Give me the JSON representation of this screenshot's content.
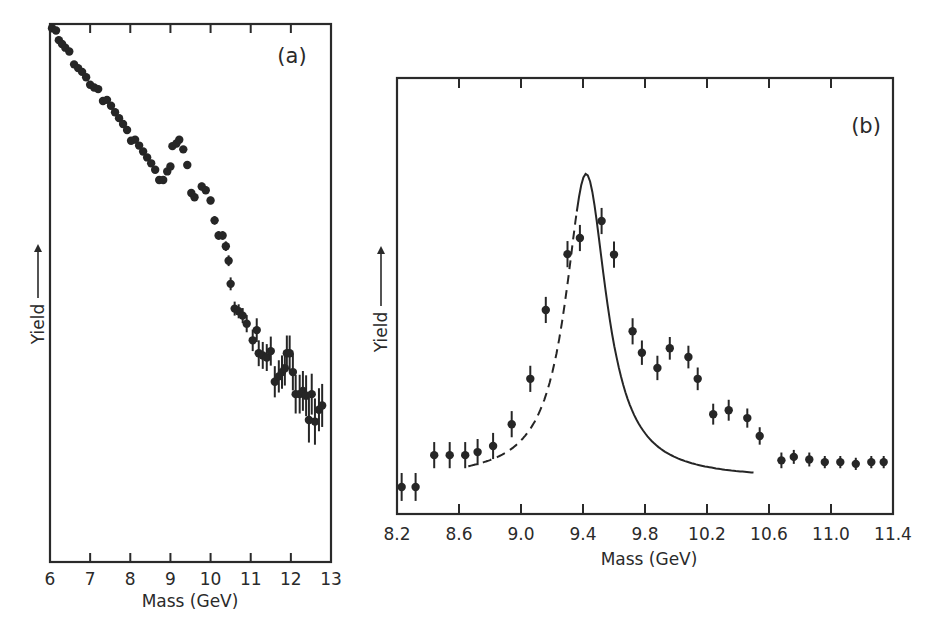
{
  "figure": {
    "panels": [
      {
        "id": "a",
        "tag": "(a)",
        "xlabel": "Mass (GeV)",
        "ylabel": "Yield —→"
      },
      {
        "id": "b",
        "tag": "(b)",
        "xlabel": "Mass (GeV)",
        "ylabel": "Yield —→"
      }
    ]
  },
  "chart_data": [
    {
      "panel": "(a)",
      "type": "scatter",
      "title": "",
      "xlabel": "Mass (GeV)",
      "ylabel": "Yield →",
      "xlim": [
        6,
        13
      ],
      "ylim": [
        0,
        100
      ],
      "xticks": [
        6,
        7,
        8,
        9,
        10,
        11,
        12,
        13
      ],
      "xtick_labels": [
        "6",
        "7",
        "8",
        "9",
        "10",
        "11",
        "12",
        "13"
      ],
      "yticks": [],
      "y_units": "relative yield (arbitrary, no scale shown)",
      "grid": false,
      "legend": null,
      "annotations": [
        "(a)"
      ],
      "series": [
        {
          "name": "data",
          "points": [
            {
              "x": 6.05,
              "y": 99.2,
              "err": 0
            },
            {
              "x": 6.15,
              "y": 98.8,
              "err": 0
            },
            {
              "x": 6.22,
              "y": 97.0,
              "err": 0
            },
            {
              "x": 6.3,
              "y": 96.3,
              "err": 0
            },
            {
              "x": 6.38,
              "y": 95.6,
              "err": 0
            },
            {
              "x": 6.48,
              "y": 94.9,
              "err": 0
            },
            {
              "x": 6.6,
              "y": 92.5,
              "err": 0
            },
            {
              "x": 6.7,
              "y": 91.8,
              "err": 0
            },
            {
              "x": 6.8,
              "y": 91.1,
              "err": 0
            },
            {
              "x": 6.9,
              "y": 90.1,
              "err": 0
            },
            {
              "x": 7.0,
              "y": 88.7,
              "err": 0
            },
            {
              "x": 7.1,
              "y": 88.2,
              "err": 0
            },
            {
              "x": 7.2,
              "y": 87.9,
              "err": 0
            },
            {
              "x": 7.32,
              "y": 85.7,
              "err": 0
            },
            {
              "x": 7.42,
              "y": 85.9,
              "err": 0
            },
            {
              "x": 7.52,
              "y": 84.8,
              "err": 0
            },
            {
              "x": 7.62,
              "y": 83.6,
              "err": 0
            },
            {
              "x": 7.72,
              "y": 82.5,
              "err": 0
            },
            {
              "x": 7.82,
              "y": 81.4,
              "err": 0
            },
            {
              "x": 7.92,
              "y": 80.3,
              "err": 0
            },
            {
              "x": 8.02,
              "y": 78.3,
              "err": 0
            },
            {
              "x": 8.12,
              "y": 78.5,
              "err": 0
            },
            {
              "x": 8.22,
              "y": 77.4,
              "err": 0
            },
            {
              "x": 8.32,
              "y": 76.3,
              "err": 0
            },
            {
              "x": 8.42,
              "y": 75.2,
              "err": 0
            },
            {
              "x": 8.52,
              "y": 74.1,
              "err": 0
            },
            {
              "x": 8.62,
              "y": 72.9,
              "err": 0
            },
            {
              "x": 8.72,
              "y": 71.0,
              "err": 0.6
            },
            {
              "x": 8.82,
              "y": 71.0,
              "err": 0.6
            },
            {
              "x": 8.92,
              "y": 72.6,
              "err": 0.6
            },
            {
              "x": 9.0,
              "y": 73.5,
              "err": 0.6
            },
            {
              "x": 9.05,
              "y": 77.3,
              "err": 0.6
            },
            {
              "x": 9.15,
              "y": 77.8,
              "err": 0.6
            },
            {
              "x": 9.22,
              "y": 78.5,
              "err": 0.6
            },
            {
              "x": 9.32,
              "y": 76.7,
              "err": 0.6
            },
            {
              "x": 9.42,
              "y": 73.8,
              "err": 0.6
            },
            {
              "x": 9.52,
              "y": 68.6,
              "err": 0.7
            },
            {
              "x": 9.6,
              "y": 67.8,
              "err": 0.7
            },
            {
              "x": 9.78,
              "y": 69.8,
              "err": 0.7
            },
            {
              "x": 9.88,
              "y": 69.1,
              "err": 0.7
            },
            {
              "x": 10.0,
              "y": 67.2,
              "err": 0.7
            },
            {
              "x": 10.1,
              "y": 63.5,
              "err": 0.8
            },
            {
              "x": 10.2,
              "y": 60.7,
              "err": 0.8
            },
            {
              "x": 10.3,
              "y": 60.7,
              "err": 0.8
            },
            {
              "x": 10.38,
              "y": 58.7,
              "err": 0.9
            },
            {
              "x": 10.45,
              "y": 56.0,
              "err": 1.0
            },
            {
              "x": 10.5,
              "y": 51.7,
              "err": 1.2
            },
            {
              "x": 10.6,
              "y": 47.1,
              "err": 1.3
            },
            {
              "x": 10.7,
              "y": 46.6,
              "err": 1.3
            },
            {
              "x": 10.8,
              "y": 45.8,
              "err": 1.4
            },
            {
              "x": 10.9,
              "y": 44.3,
              "err": 1.6
            },
            {
              "x": 11.05,
              "y": 41.2,
              "err": 2.0
            },
            {
              "x": 11.15,
              "y": 43.1,
              "err": 2.2
            },
            {
              "x": 11.2,
              "y": 38.8,
              "err": 2.4
            },
            {
              "x": 11.3,
              "y": 38.4,
              "err": 2.5
            },
            {
              "x": 11.4,
              "y": 38.0,
              "err": 2.5
            },
            {
              "x": 11.5,
              "y": 39.2,
              "err": 2.7
            },
            {
              "x": 11.6,
              "y": 33.5,
              "err": 2.9
            },
            {
              "x": 11.7,
              "y": 34.5,
              "err": 3.0
            },
            {
              "x": 11.78,
              "y": 35.3,
              "err": 3.1
            },
            {
              "x": 11.85,
              "y": 36.0,
              "err": 3.2
            },
            {
              "x": 11.9,
              "y": 38.8,
              "err": 3.3
            },
            {
              "x": 11.97,
              "y": 38.8,
              "err": 3.3
            },
            {
              "x": 12.05,
              "y": 35.3,
              "err": 3.4
            },
            {
              "x": 12.12,
              "y": 31.2,
              "err": 3.6
            },
            {
              "x": 12.22,
              "y": 31.2,
              "err": 3.6
            },
            {
              "x": 12.3,
              "y": 31.8,
              "err": 3.7
            },
            {
              "x": 12.38,
              "y": 30.9,
              "err": 3.8
            },
            {
              "x": 12.45,
              "y": 26.4,
              "err": 4.2
            },
            {
              "x": 12.52,
              "y": 31.2,
              "err": 3.8
            },
            {
              "x": 12.6,
              "y": 26.1,
              "err": 4.3
            },
            {
              "x": 12.7,
              "y": 28.3,
              "err": 4.0
            },
            {
              "x": 12.78,
              "y": 29.1,
              "err": 4.0
            }
          ]
        }
      ]
    },
    {
      "panel": "(b)",
      "type": "scatter",
      "title": "",
      "xlabel": "Mass (GeV)",
      "ylabel": "Yield →",
      "xlim": [
        8.2,
        11.4
      ],
      "ylim": [
        0,
        100
      ],
      "xticks": [
        8.2,
        8.6,
        9.0,
        9.4,
        9.8,
        10.2,
        10.6,
        11.0,
        11.4
      ],
      "xtick_labels": [
        "8.2",
        "8.6",
        "9.0",
        "9.4",
        "9.8",
        "10.2",
        "10.6",
        "11.0",
        "11.4"
      ],
      "yticks": [],
      "y_units": "relative yield (arbitrary, no scale shown)",
      "grid": false,
      "legend": null,
      "annotations": [
        "(b)"
      ],
      "series": [
        {
          "name": "data",
          "points": [
            {
              "x": 8.23,
              "y": 6.2,
              "err": 3.2
            },
            {
              "x": 8.32,
              "y": 6.2,
              "err": 3.2
            },
            {
              "x": 8.44,
              "y": 13.5,
              "err": 3.0
            },
            {
              "x": 8.54,
              "y": 13.5,
              "err": 3.0
            },
            {
              "x": 8.64,
              "y": 13.5,
              "err": 3.0
            },
            {
              "x": 8.72,
              "y": 14.2,
              "err": 3.0
            },
            {
              "x": 8.82,
              "y": 15.6,
              "err": 3.0
            },
            {
              "x": 8.94,
              "y": 20.6,
              "err": 3.0
            },
            {
              "x": 9.06,
              "y": 31.0,
              "err": 3.0
            },
            {
              "x": 9.16,
              "y": 46.8,
              "err": 3.0
            },
            {
              "x": 9.3,
              "y": 59.6,
              "err": 3.0
            },
            {
              "x": 9.38,
              "y": 63.3,
              "err": 3.0
            },
            {
              "x": 9.52,
              "y": 67.2,
              "err": 3.0
            },
            {
              "x": 9.6,
              "y": 59.5,
              "err": 3.0
            },
            {
              "x": 9.72,
              "y": 41.9,
              "err": 3.0
            },
            {
              "x": 9.78,
              "y": 37.0,
              "err": 2.8
            },
            {
              "x": 9.88,
              "y": 33.5,
              "err": 2.8
            },
            {
              "x": 9.96,
              "y": 38.0,
              "err": 2.6
            },
            {
              "x": 10.08,
              "y": 36.0,
              "err": 2.6
            },
            {
              "x": 10.14,
              "y": 31.0,
              "err": 2.6
            },
            {
              "x": 10.24,
              "y": 22.9,
              "err": 2.4
            },
            {
              "x": 10.34,
              "y": 23.8,
              "err": 2.4
            },
            {
              "x": 10.46,
              "y": 22.0,
              "err": 2.2
            },
            {
              "x": 10.54,
              "y": 17.9,
              "err": 2.0
            },
            {
              "x": 10.68,
              "y": 12.3,
              "err": 1.8
            },
            {
              "x": 10.76,
              "y": 13.1,
              "err": 1.6
            },
            {
              "x": 10.86,
              "y": 12.5,
              "err": 1.6
            },
            {
              "x": 10.96,
              "y": 11.9,
              "err": 1.4
            },
            {
              "x": 11.06,
              "y": 11.9,
              "err": 1.4
            },
            {
              "x": 11.16,
              "y": 11.5,
              "err": 1.4
            },
            {
              "x": 11.26,
              "y": 11.9,
              "err": 1.4
            },
            {
              "x": 11.34,
              "y": 11.9,
              "err": 1.4
            }
          ]
        }
      ],
      "fit_curves": [
        {
          "name": "Upsilon(1S) peak",
          "style": "solid",
          "center": 9.42,
          "amplitude": 70.0,
          "width": 0.16,
          "baseline": 0,
          "segments": [
            [
              8.66,
              9.36,
              "dashed-solid"
            ],
            [
              9.36,
              10.5,
              "solid"
            ]
          ]
        },
        {
          "name": "Upsilon(2S) peak",
          "style": "solid-dashed",
          "center": 9.99,
          "amplitude": 34.0,
          "width": 0.14,
          "segments": [
            [
              9.42,
              10.1,
              "solid"
            ],
            [
              10.1,
              10.66,
              "solid"
            ]
          ]
        },
        {
          "name": "Upsilon(3S) peak",
          "style": "dashed",
          "center": 10.34,
          "amplitude": 19.0,
          "width": 0.16,
          "segments": [
            [
              10.02,
              10.86,
              "dashed"
            ]
          ]
        }
      ]
    }
  ]
}
